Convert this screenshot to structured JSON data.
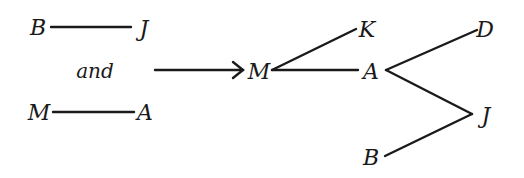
{
  "diagram": {
    "type": "graph-merge",
    "left": {
      "graph1": {
        "nodes": [
          "B",
          "J"
        ],
        "edges": [
          [
            "B",
            "J"
          ]
        ]
      },
      "connector_text": "and",
      "graph2": {
        "nodes": [
          "M",
          "A"
        ],
        "edges": [
          [
            "M",
            "A"
          ]
        ]
      }
    },
    "arrow": {
      "direction": "right"
    },
    "right": {
      "nodes": [
        "M",
        "K",
        "A",
        "D",
        "J",
        "B"
      ],
      "edges": [
        [
          "M",
          "K"
        ],
        [
          "M",
          "A"
        ],
        [
          "A",
          "D"
        ],
        [
          "A",
          "J"
        ],
        [
          "J",
          "B"
        ]
      ]
    }
  },
  "labels": {
    "left_b": "B",
    "left_j": "J",
    "and": "and",
    "left_m": "M",
    "left_a": "A",
    "right_m": "M",
    "right_k": "K",
    "right_a": "A",
    "right_d": "D",
    "right_j": "J",
    "right_b": "B"
  },
  "colors": {
    "ink": "#1a1a1a",
    "background": "#ffffff"
  }
}
